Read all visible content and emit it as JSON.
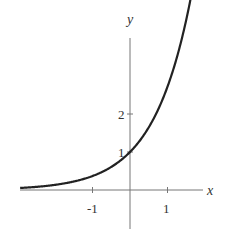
{
  "chart_data": {
    "type": "line",
    "title": "",
    "xlabel": "x",
    "ylabel": "y",
    "function": "y = e^x",
    "xlim": [
      -2.95,
      1.95
    ],
    "ylim": [
      -1.0,
      4.0
    ],
    "x_ticks": [
      {
        "value": -1,
        "label": "-1"
      },
      {
        "value": 1,
        "label": "1"
      }
    ],
    "y_ticks": [
      {
        "value": 1,
        "label": "1"
      },
      {
        "value": 2,
        "label": "2"
      }
    ],
    "grid": false,
    "legend": null,
    "series": [
      {
        "name": "exponential curve",
        "x": [
          -2.93,
          -2.5,
          -2.0,
          -1.5,
          -1.0,
          -0.5,
          0.0,
          0.5,
          1.0,
          1.5,
          1.95
        ],
        "y": [
          0.053,
          0.082,
          0.135,
          0.223,
          0.368,
          0.607,
          1.0,
          1.649,
          2.718,
          4.0,
          4.0
        ]
      }
    ]
  },
  "labels": {
    "x_axis": "x",
    "y_axis": "y",
    "tick_x_neg1": "-1",
    "tick_x_1": "1",
    "tick_y_1": "1",
    "tick_y_2": "2"
  }
}
